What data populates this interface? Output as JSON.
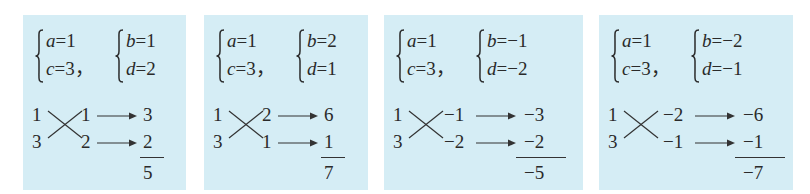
{
  "panels": [
    {
      "system1": {
        "line1_var": "a",
        "line1_val": "1",
        "line2_var": "c",
        "line2_val": "3",
        "sep": "，"
      },
      "system2": {
        "line1_var": "b",
        "line1_val": "1",
        "line2_var": "d",
        "line2_val": "2"
      },
      "cross": {
        "left_top": "1",
        "left_bottom": "3",
        "right_top": "1",
        "right_bottom": "2"
      },
      "products": {
        "top": "3",
        "bottom": "2",
        "sum": "5"
      }
    },
    {
      "system1": {
        "line1_var": "a",
        "line1_val": "1",
        "line2_var": "c",
        "line2_val": "3",
        "sep": "，"
      },
      "system2": {
        "line1_var": "b",
        "line1_val": "2",
        "line2_var": "d",
        "line2_val": "1"
      },
      "cross": {
        "left_top": "1",
        "left_bottom": "3",
        "right_top": "2",
        "right_bottom": "1"
      },
      "products": {
        "top": "6",
        "bottom": "1",
        "sum": "7"
      }
    },
    {
      "system1": {
        "line1_var": "a",
        "line1_val": "1",
        "line2_var": "c",
        "line2_val": "3",
        "sep": "，"
      },
      "system2": {
        "line1_var": "b",
        "line1_val": "−1",
        "line2_var": "d",
        "line2_val": "−2"
      },
      "cross": {
        "left_top": "1",
        "left_bottom": "3",
        "right_top": "−1",
        "right_bottom": "−2"
      },
      "products": {
        "top": "−3",
        "bottom": "−2",
        "sum": "−5"
      }
    },
    {
      "system1": {
        "line1_var": "a",
        "line1_val": "1",
        "line2_var": "c",
        "line2_val": "3",
        "sep": "，"
      },
      "system2": {
        "line1_var": "b",
        "line1_val": "−2",
        "line2_var": "d",
        "line2_val": "−1"
      },
      "cross": {
        "left_top": "1",
        "left_bottom": "3",
        "right_top": "−2",
        "right_bottom": "−1"
      },
      "products": {
        "top": "−6",
        "bottom": "−1",
        "sum": "−7"
      }
    }
  ],
  "colors": {
    "panel_bg": "#d5edf5",
    "ink": "#2a2a2a"
  }
}
